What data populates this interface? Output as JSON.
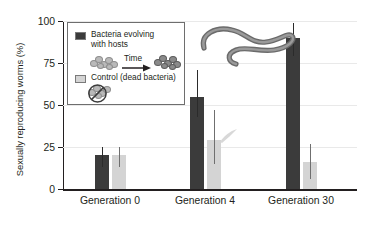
{
  "chart_data": {
    "type": "bar",
    "title": "",
    "xlabel": "",
    "ylabel": "Sexually reproducing worms (%)",
    "ylim": [
      0,
      100
    ],
    "yticks": [
      0,
      25,
      50,
      75,
      100
    ],
    "grid": true,
    "legend_position": "top-left",
    "categories": [
      "Generation 0",
      "Generation 4",
      "Generation 30"
    ],
    "series": [
      {
        "name": "Bacteria evolving with hosts",
        "color": "#3b3b3b",
        "values": [
          20,
          55,
          90
        ],
        "error_low": [
          13,
          43,
          79
        ],
        "error_high": [
          25,
          71,
          99
        ]
      },
      {
        "name": "Control (dead bacteria)",
        "color": "#d4d4d4",
        "values": [
          20,
          29,
          16
        ],
        "error_low": [
          13,
          15,
          6
        ],
        "error_high": [
          25,
          47,
          27
        ]
      }
    ]
  },
  "axis": {
    "y_tick_labels": [
      "0",
      "25",
      "50",
      "75",
      "100"
    ],
    "y_title": "Sexually reproducing worms (%)",
    "x_tick_labels": [
      "Generation 0",
      "Generation 4",
      "Generation 30"
    ]
  },
  "legend": {
    "entries": [
      {
        "swatch": "dark",
        "label_line1": "Bacteria evolving",
        "label_line2": "with hosts"
      },
      {
        "swatch": "light",
        "label_line1": "Control (dead bacteria)",
        "label_line2": ""
      }
    ],
    "time_arrow_label": "Time"
  },
  "graphics": {
    "worm_photo": "c-elegans-worm-photograph",
    "bacteria_cluster_before": "bacteria-cluster-light-icon",
    "bacteria_cluster_after": "bacteria-cluster-dark-icon",
    "dead_bacteria": "bacteria-cluster-prohibited-icon"
  },
  "colors": {
    "series_dark": "#3b3b3b",
    "series_light": "#d4d4d4",
    "axis": "#231f20",
    "grid": "#e9e9e9",
    "background": "#ffffff"
  }
}
